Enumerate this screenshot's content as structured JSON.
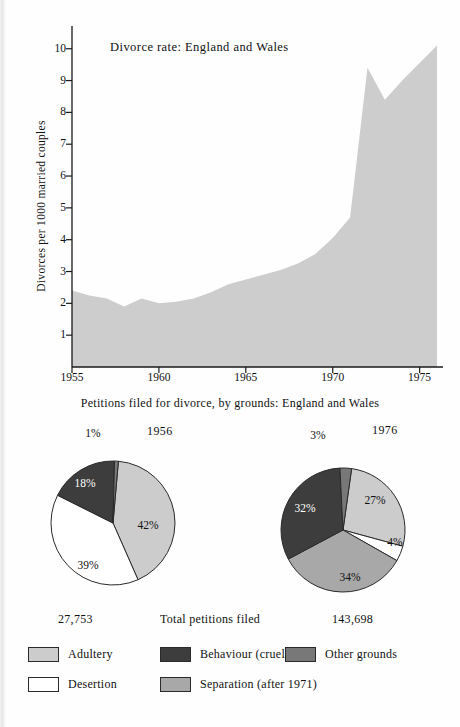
{
  "colors": {
    "adultery": "#cccccc",
    "desertion": "#ffffff",
    "behaviour": "#3d3d3d",
    "separation": "#a8a8a8",
    "other": "#787878",
    "area_fill": "#cdcdcd",
    "axis": "#1a1a1a",
    "text": "#111111"
  },
  "area_chart": {
    "title": "Divorce rate:  England and Wales",
    "ylabel": "Divorces per 1000 married couples",
    "caption": "Petitions filed for divorce, by grounds: England and Wales",
    "yticks": [
      "1",
      "2",
      "3",
      "4",
      "5",
      "6",
      "7",
      "8",
      "9",
      "10"
    ],
    "xticks": [
      "1955",
      "1960",
      "1965",
      "1970",
      "1975"
    ]
  },
  "pies": {
    "left": {
      "year": "1956",
      "total": "27,753",
      "slices": [
        {
          "label": "Adultery",
          "pct": "42%",
          "value": 42,
          "color_key": "adultery"
        },
        {
          "label": "Desertion",
          "pct": "39%",
          "value": 39,
          "color_key": "desertion"
        },
        {
          "label": "Behaviour (cruelty)",
          "pct": "18%",
          "value": 18,
          "color_key": "behaviour"
        },
        {
          "label": "Other grounds",
          "pct": "1%",
          "value": 1,
          "color_key": "other"
        }
      ]
    },
    "right": {
      "year": "1976",
      "total": "143,698",
      "slices": [
        {
          "label": "Adultery",
          "pct": "27%",
          "value": 27,
          "color_key": "adultery"
        },
        {
          "label": "Desertion",
          "pct": "4%",
          "value": 4,
          "color_key": "desertion"
        },
        {
          "label": "Separation (after 1971)",
          "pct": "34%",
          "value": 34,
          "color_key": "separation"
        },
        {
          "label": "Behaviour (cruelty)",
          "pct": "32%",
          "value": 32,
          "color_key": "behaviour"
        },
        {
          "label": "Other grounds",
          "pct": "3%",
          "value": 3,
          "color_key": "other"
        }
      ]
    },
    "totals_label": "Total petitions filed"
  },
  "legend": [
    {
      "label": "Adultery",
      "color_key": "adultery",
      "col": 0,
      "row": 0
    },
    {
      "label": "Desertion",
      "color_key": "desertion",
      "col": 0,
      "row": 1
    },
    {
      "label": "Behaviour (cruelty)",
      "color_key": "behaviour",
      "col": 1,
      "row": 0
    },
    {
      "label": "Separation (after 1971)",
      "color_key": "separation",
      "col": 1,
      "row": 1
    },
    {
      "label": "Other grounds",
      "color_key": "other",
      "col": 2,
      "row": 0
    }
  ],
  "chart_data": [
    {
      "type": "area",
      "title": "Divorce rate:  England and Wales",
      "xlabel": "",
      "ylabel": "Divorces per 1000 married couples",
      "xlim": [
        1955,
        1976
      ],
      "ylim": [
        0,
        10.4
      ],
      "yticks": [
        1,
        2,
        3,
        4,
        5,
        6,
        7,
        8,
        9,
        10
      ],
      "xticks": [
        1955,
        1960,
        1965,
        1970,
        1975
      ],
      "grid": false,
      "legend": "none",
      "x": [
        1955,
        1956,
        1957,
        1958,
        1959,
        1960,
        1961,
        1962,
        1963,
        1964,
        1965,
        1966,
        1967,
        1968,
        1969,
        1970,
        1971,
        1972,
        1973,
        1974,
        1975,
        1976
      ],
      "values": [
        2.4,
        2.25,
        2.15,
        1.9,
        2.15,
        2.0,
        2.05,
        2.15,
        2.35,
        2.6,
        2.75,
        2.9,
        3.05,
        3.25,
        3.55,
        4.05,
        4.7,
        9.4,
        8.4,
        9.0,
        9.55,
        10.1
      ],
      "series_name": "Divorces per 1000 married couples"
    },
    {
      "type": "pie",
      "title": "1956",
      "subtitle": "Total petitions filed 27,753",
      "labels": [
        "Adultery",
        "Desertion",
        "Behaviour (cruelty)",
        "Other grounds"
      ],
      "values": [
        42,
        39,
        18,
        1
      ],
      "unit": "%"
    },
    {
      "type": "pie",
      "title": "1976",
      "subtitle": "Total petitions filed 143,698",
      "labels": [
        "Adultery",
        "Desertion",
        "Separation (after 1971)",
        "Behaviour (cruelty)",
        "Other grounds"
      ],
      "values": [
        27,
        4,
        34,
        32,
        3
      ],
      "unit": "%"
    }
  ]
}
